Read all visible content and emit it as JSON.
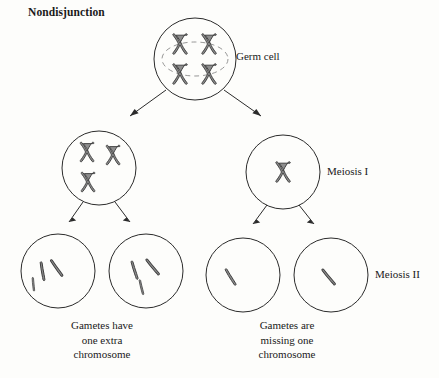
{
  "diagram": {
    "title": "Nondisjunction",
    "labels": {
      "germ_cell": "Germ cell",
      "meiosis_i": "Meiosis I",
      "meiosis_ii": "Meiosis II"
    },
    "captions": {
      "left": {
        "line1": "Gametes have",
        "line2": "one extra",
        "line3": "chromosome"
      },
      "right": {
        "line1": "Gametes are",
        "line2": "missing one",
        "line3": "chromosome"
      }
    },
    "colors": {
      "background": "#fdfdfb",
      "cell_outline": "#2b2b2b",
      "chromosome_fill": "#8e8e8e",
      "chromosome_outline": "#3a3a3a",
      "nuclear_membrane": "#8a8a8a",
      "text": "#1a1a1a"
    },
    "stages": [
      {
        "name": "germ-cell",
        "level": "parent",
        "cells": [
          {
            "id": "germ-cell",
            "chromosome_count": 4,
            "chromosome_type": "duplicated-x",
            "has_nuclear_membrane": true
          }
        ]
      },
      {
        "name": "meiosis-i",
        "level": "daughter",
        "cells": [
          {
            "id": "meiosis-i-cell-left",
            "chromosome_count": 3,
            "chromosome_type": "duplicated-x",
            "has_nuclear_membrane": false
          },
          {
            "id": "meiosis-i-cell-right",
            "chromosome_count": 1,
            "chromosome_type": "duplicated-x",
            "has_nuclear_membrane": false
          }
        ]
      },
      {
        "name": "meiosis-ii",
        "level": "gamete",
        "cells": [
          {
            "id": "gamete-1",
            "chromosome_count": 3,
            "chromosome_type": "single-chromatid",
            "has_nuclear_membrane": false
          },
          {
            "id": "gamete-2",
            "chromosome_count": 3,
            "chromosome_type": "single-chromatid",
            "has_nuclear_membrane": false
          },
          {
            "id": "gamete-3",
            "chromosome_count": 1,
            "chromosome_type": "single-chromatid",
            "has_nuclear_membrane": false
          },
          {
            "id": "gamete-4",
            "chromosome_count": 1,
            "chromosome_type": "single-chromatid",
            "has_nuclear_membrane": false
          }
        ]
      }
    ]
  }
}
